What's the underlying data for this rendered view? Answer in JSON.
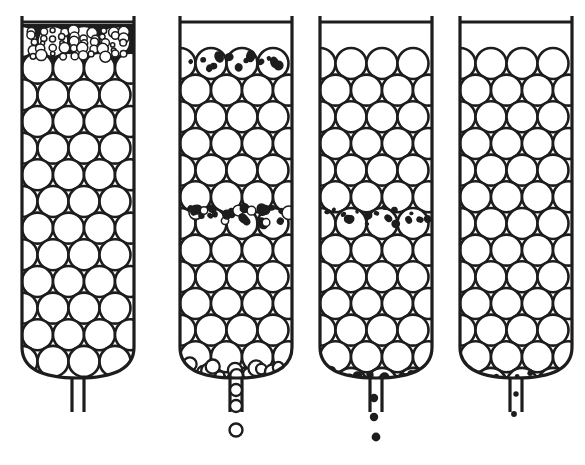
{
  "figure": {
    "background_color": "#ffffff",
    "ink_color": "#1d1d1d",
    "panel_count": 4
  },
  "geometry": {
    "canvas_width": 585,
    "canvas_height": 465,
    "column_inner_width": 112,
    "column_top_y": 20,
    "column_body_bottom_y": 378,
    "outlet_tube_bottom_y": 412,
    "outlet_tube_half_gap": 6,
    "big_sphere_radius": 15.5,
    "wall_stroke_width": 3.2,
    "rim_stroke_width": 3.0
  },
  "columns": [
    {
      "id": "column-1",
      "label": "Column 1 — fines capped on top of bed",
      "left_x": 22,
      "right_x": 134,
      "has_rim_bar": true,
      "rim_bar_y": 22,
      "wall_top_tick_y": 16,
      "bed_top_y": 26,
      "bed_rows": 12,
      "fines_zone": {
        "present": true,
        "position": "top-cap",
        "style": "dark-field-with-white-fines",
        "top_y": 24,
        "bottom_y": 60,
        "fine_radius": 4.2,
        "fine_count": 54,
        "description": "Dense dark matrix filled with small white circles forming a surface cake layer"
      },
      "mid_band": {
        "present": false
      },
      "bottom_zone": {
        "present": false
      },
      "outlet": {
        "present": true,
        "discharging": false,
        "falling_particles": []
      }
    },
    {
      "id": "column-2",
      "label": "Column 2 — coarse fines migrating downward",
      "left_x": 180,
      "right_x": 292,
      "has_rim_bar": true,
      "rim_bar_y": 22,
      "wall_top_tick_y": 16,
      "bed_top_y": 48,
      "bed_rows": 11,
      "fines_zone": {
        "present": true,
        "position": "top-row-interstices",
        "style": "dark-blobs-in-white-spheres",
        "top_y": 48,
        "bottom_y": 76,
        "fine_radius": 3.6,
        "fine_count": 13,
        "description": "Dark irregular blobs lodged inside and between the uppermost row of coarse spheres"
      },
      "mid_band": {
        "present": true,
        "center_y": 215,
        "height": 26,
        "fine_radius": 4.0,
        "fine_count": 26,
        "style": "mixed-dark-and-ring",
        "description": "Broad band of medium dark particles spanning the full bed width"
      },
      "bottom_zone": {
        "present": true,
        "center_y": 366,
        "particle_type": "white-ring",
        "fine_radius": 6.0,
        "fine_count": 12,
        "description": "Medium white ring particles collecting just above the outlet"
      },
      "outlet": {
        "present": true,
        "discharging": true,
        "falling_particles": [
          {
            "cx": 236,
            "cy": 390,
            "r": 6.0,
            "type": "white-ring"
          },
          {
            "cx": 236,
            "cy": 406,
            "r": 6.0,
            "type": "white-ring"
          },
          {
            "cx": 236,
            "cy": 430,
            "r": 6.5,
            "type": "white-ring"
          }
        ]
      }
    },
    {
      "id": "column-3",
      "label": "Column 3 — medium fines reaching the outlet",
      "left_x": 320,
      "right_x": 432,
      "has_rim_bar": true,
      "rim_bar_y": 22,
      "wall_top_tick_y": 16,
      "bed_top_y": 48,
      "bed_rows": 11,
      "fines_zone": {
        "present": false
      },
      "mid_band": {
        "present": true,
        "center_y": 216,
        "height": 20,
        "fine_radius": 3.1,
        "fine_count": 17,
        "style": "dark-dots-in-spheres",
        "description": "Narrow band of small dark dots lodged inside the coarse spheres"
      },
      "bottom_zone": {
        "present": true,
        "center_y": 370,
        "particle_type": "dark-dot",
        "fine_radius": 4.2,
        "fine_count": 12,
        "description": "Small dark particles gathering in the conical base"
      },
      "outlet": {
        "present": true,
        "discharging": true,
        "falling_particles": [
          {
            "cx": 374,
            "cy": 398,
            "r": 4.2,
            "type": "dark-dot"
          },
          {
            "cx": 374,
            "cy": 417,
            "r": 4.2,
            "type": "dark-dot"
          },
          {
            "cx": 376,
            "cy": 437,
            "r": 4.4,
            "type": "dark-dot"
          }
        ]
      }
    },
    {
      "id": "column-4",
      "label": "Column 4 — finest particles fully flushed through",
      "left_x": 460,
      "right_x": 572,
      "has_rim_bar": true,
      "rim_bar_y": 22,
      "wall_top_tick_y": 16,
      "bed_top_y": 48,
      "bed_rows": 11,
      "fines_zone": {
        "present": false
      },
      "mid_band": {
        "present": false
      },
      "bottom_zone": {
        "present": true,
        "center_y": 372,
        "particle_type": "tiny-dark-dot",
        "fine_radius": 2.6,
        "fine_count": 17,
        "description": "Very fine dark specks resting on the bottom of the bed"
      },
      "outlet": {
        "present": true,
        "discharging": true,
        "falling_particles": [
          {
            "cx": 516,
            "cy": 394,
            "r": 2.7,
            "type": "tiny-dark-dot"
          },
          {
            "cx": 514,
            "cy": 414,
            "r": 2.9,
            "type": "tiny-dark-dot"
          }
        ]
      }
    }
  ],
  "legend_keys": {
    "coarse_sphere": "Coarse packing sphere (white, outlined)",
    "medium_particle": "Medium fine particle",
    "fine_particle": "Fine particle (dark)",
    "surface_cake": "Surface cake of fines",
    "outlet_nozzle": "Outlet nozzle"
  }
}
